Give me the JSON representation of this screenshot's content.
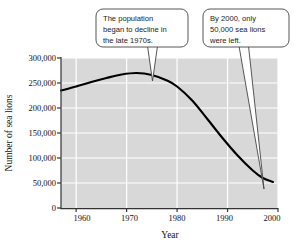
{
  "figure": {
    "plot_bg_color": "#d8d8d8",
    "grid_color": "#ffffff",
    "line_color": "#000000",
    "axis_color": "#333333",
    "callout_fill": "#ffffff",
    "callout_stroke": "#444444"
  },
  "chart_data": {
    "type": "line",
    "title": "",
    "xlabel": "Year",
    "ylabel": "Number of sea lions",
    "xlim": [
      1957,
      2000
    ],
    "ylim": [
      0,
      300000
    ],
    "grid": true,
    "legend": "none",
    "xticks": [
      "1960",
      "1970",
      "1980",
      "1990",
      "2000"
    ],
    "xtick_values": [
      1960,
      1970,
      1980,
      1990,
      2000
    ],
    "yticks": [
      "0",
      "50,000",
      "100,000",
      "150,000",
      "200,000",
      "250,000",
      "300,000"
    ],
    "ytick_values": [
      0,
      50000,
      100000,
      150000,
      200000,
      250000,
      300000
    ],
    "series": [
      {
        "name": "Steller sea lion population",
        "x": [
          1957,
          1960,
          1963,
          1966,
          1969,
          1972,
          1975,
          1978,
          1980,
          1983,
          1986,
          1989,
          1992,
          1995,
          1997,
          1999
        ],
        "values": [
          235000,
          243000,
          252000,
          260000,
          267000,
          270000,
          266000,
          255000,
          243000,
          215000,
          178000,
          140000,
          105000,
          75000,
          60000,
          52000
        ]
      }
    ],
    "annotations": [
      {
        "id": "callout-decline",
        "lines": [
          "The population",
          "began to decline in",
          "the late 1970s."
        ],
        "target_year": 1978,
        "target_value": 255000
      },
      {
        "id": "callout-remaining",
        "lines": [
          "By 2000, only",
          "50,000 sea lions",
          "were left."
        ],
        "target_year": 1999,
        "target_value": 52000
      }
    ]
  },
  "axes": {
    "x_title": "Year",
    "y_title": "Number of sea lions"
  }
}
